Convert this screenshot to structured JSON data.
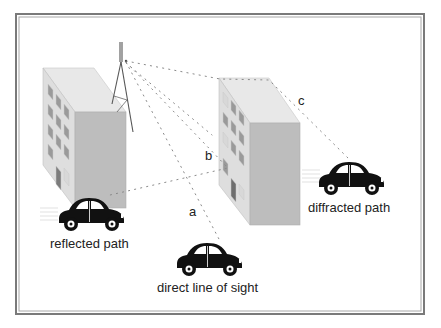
{
  "diagram": {
    "colors": {
      "frame": "#7a7a7a",
      "building_roof": "#e6e6e6",
      "building_side": "#bdbdbd",
      "building_front": "#dcdcdc",
      "window": "#9a9a9a",
      "car": "#111111",
      "ray": "#8a8a8a",
      "text": "#222222"
    },
    "paths": [
      {
        "id": "a",
        "letter": "a",
        "label": "direct line of sight"
      },
      {
        "id": "b",
        "letter": "b",
        "label": "reflected path"
      },
      {
        "id": "c",
        "letter": "c",
        "label": "diffracted path"
      }
    ],
    "elements": {
      "antenna": "transmitter-tower",
      "buildings": [
        "left-building",
        "right-building"
      ],
      "cars": [
        "reflected-car",
        "direct-car",
        "diffracted-car"
      ]
    }
  }
}
